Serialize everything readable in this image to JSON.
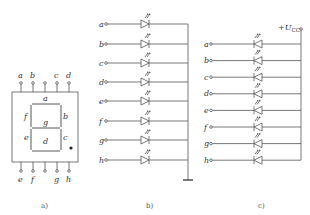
{
  "panel_a": {
    "caption": "a)",
    "top_pins": [
      "a",
      "b",
      "",
      "c",
      "d"
    ],
    "bottom_pins": [
      "e",
      "f",
      "",
      "g",
      "h"
    ],
    "segments": {
      "a": "a",
      "b": "b",
      "c": "c",
      "d": "d",
      "e": "e",
      "f": "f",
      "g": "g"
    },
    "decimal_point": "dot"
  },
  "panel_b": {
    "caption": "b)",
    "type": "common-cathode",
    "rows": [
      "a",
      "b",
      "c",
      "d",
      "e",
      "f",
      "g",
      "h"
    ],
    "common": "ground-symbol"
  },
  "panel_c": {
    "caption": "c)",
    "type": "common-anode",
    "rows": [
      "a",
      "b",
      "c",
      "d",
      "e",
      "f",
      "g",
      "h"
    ],
    "supply_label": "+U",
    "supply_sub": "CC"
  }
}
